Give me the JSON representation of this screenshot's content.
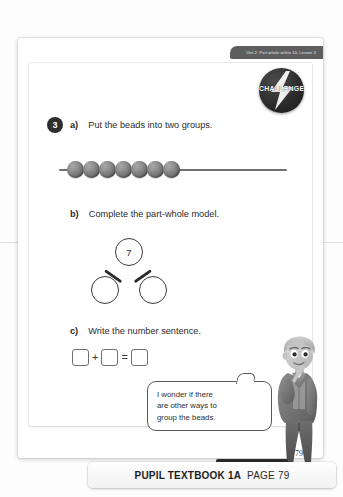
{
  "page": {
    "unit_tab": "Unit 2: Part-whole within 10, Lesson 3",
    "page_number": "79"
  },
  "badge": {
    "label": "CHALLENGE",
    "icon": "lightning-bolt-icon"
  },
  "question": {
    "number": "3",
    "part_a": {
      "marker": "a)",
      "text": "Put the beads into two groups."
    },
    "part_b": {
      "marker": "b)",
      "text": "Complete the part-whole model."
    },
    "part_c": {
      "marker": "c)",
      "text": "Write the number sentence."
    }
  },
  "bead_string": {
    "bead_count": 7,
    "bead_color": "#8a8a8a",
    "wire_color": "#6f6f6f"
  },
  "part_whole_model": {
    "whole": "7",
    "part_left": "",
    "part_right": ""
  },
  "number_sentence": {
    "box1": "",
    "plus": "+",
    "box2": "",
    "equals": "=",
    "box3": ""
  },
  "speech_bubble": {
    "line1": "I wonder if there",
    "line2": "are other ways to",
    "line3": "group the beads."
  },
  "footer": {
    "practice_book": "→ Practice book 1A p56",
    "bar_title": "PUPIL TEXTBOOK 1A",
    "bar_page": "PAGE 79"
  }
}
